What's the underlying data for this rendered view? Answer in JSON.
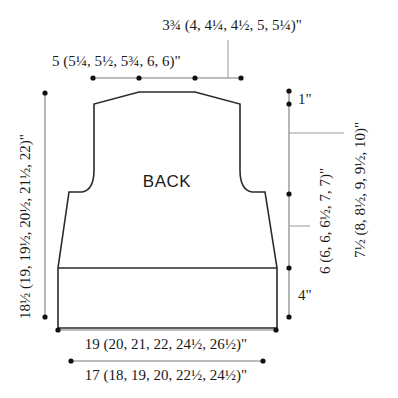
{
  "diagram": {
    "piece_label": "BACK",
    "colors": {
      "outline": "#2a2a2a",
      "dimension_line": "#7a7a7a",
      "dot": "#111111",
      "text": "#1a1a1a",
      "background": "#ffffff"
    },
    "dimensions": {
      "shoulder_width": "3¾ (4, 4¼, 4½, 5, 5¼)\"",
      "neck_width": "5 (5¼, 5½, 5¾, 6, 6)\"",
      "shoulder_slope": "1\"",
      "armhole_depth": "7½ (8, 8½, 9, 9½, 10)\"",
      "side_length": "6 (6, 6, 6½, 7, 7)\"",
      "ribbing_height": "4\"",
      "total_length": "18½ (19, 19½, 20½, 21½, 22)\"",
      "lower_width": "19 (20, 21, 22, 24½, 26½)\"",
      "rib_width": "17 (18, 19, 20, 22½, 24½)\""
    }
  }
}
